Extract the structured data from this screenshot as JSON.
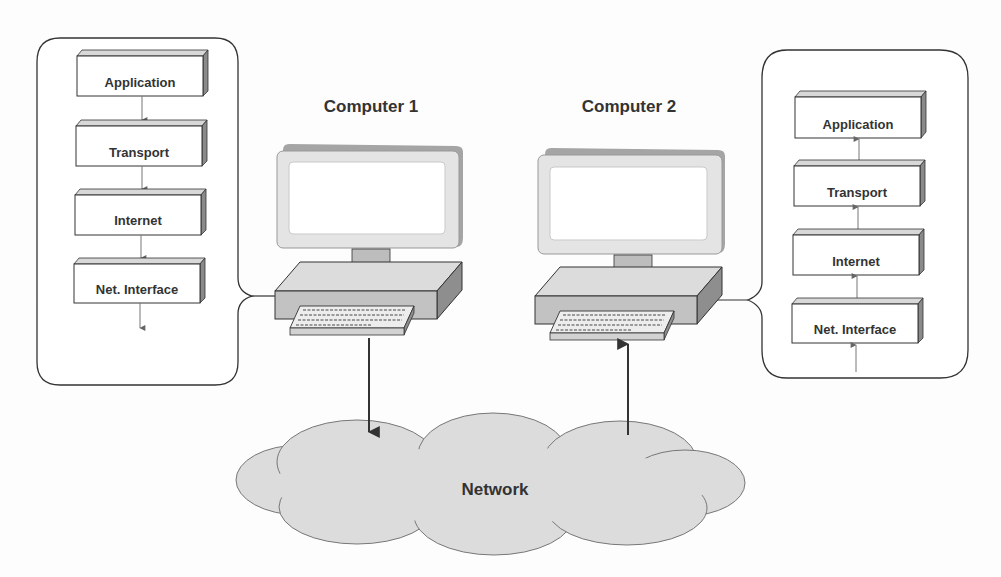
{
  "diagram": {
    "type": "network-protocol-stack",
    "computers": [
      {
        "id": "computer1",
        "label": "Computer 1",
        "direction": "down"
      },
      {
        "id": "computer2",
        "label": "Computer 2",
        "direction": "up"
      }
    ],
    "stack_left": {
      "layers": [
        "Application",
        "Transport",
        "Internet",
        "Net. Interface"
      ],
      "arrow_direction": "down"
    },
    "stack_right": {
      "layers": [
        "Application",
        "Transport",
        "Internet",
        "Net. Interface"
      ],
      "arrow_direction": "up"
    },
    "network": {
      "label": "Network"
    },
    "colors": {
      "outline": "#3a3a3a",
      "box_fill": "#ffffff",
      "box_top": "#dcdcdc",
      "box_side": "#8a8a8a",
      "arrow": "#555555",
      "cloud": "#dedede",
      "monitor": "#e6e6e6",
      "monitor_shadow": "#a8a8a8",
      "base": "#cfcfcf"
    }
  }
}
